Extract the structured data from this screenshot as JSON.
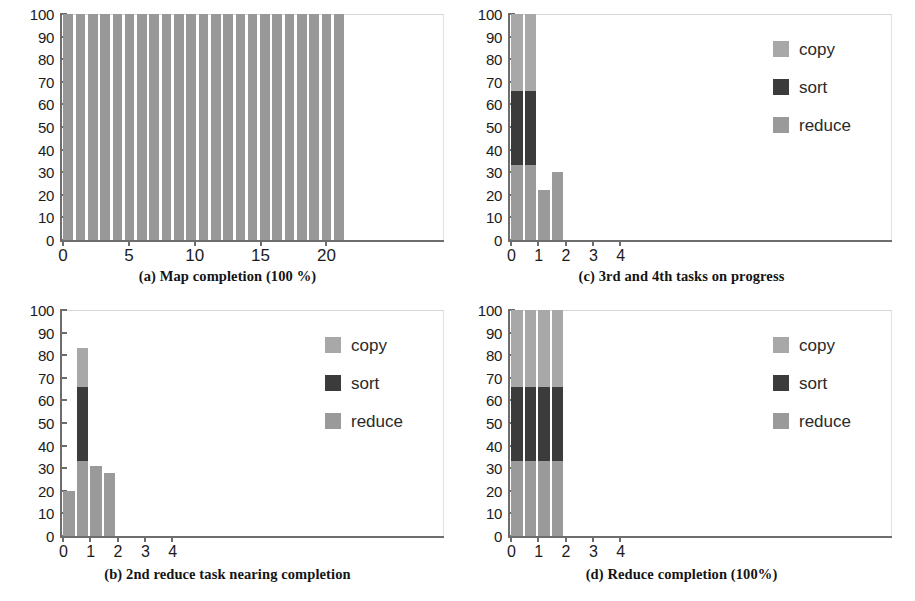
{
  "figure": {
    "colors": {
      "copy": "#a8a8a8",
      "sort": "#3b3b3b",
      "reduce": "#9a9a9a",
      "bar_a": "#989898",
      "axis": "#6d6d6d",
      "text": "#1b1b1b",
      "background": "#ffffff"
    },
    "legend_labels": {
      "copy": "copy",
      "sort": "sort",
      "reduce": "reduce"
    },
    "y_ticks": [
      "0",
      "10",
      "20",
      "30",
      "40",
      "50",
      "60",
      "70",
      "80",
      "90",
      "100"
    ]
  },
  "chart_data": [
    {
      "id": "a",
      "type": "bar",
      "title": "(a) Map completion (100 %)",
      "xlabel": "",
      "ylabel": "",
      "ylim": [
        0,
        100
      ],
      "xlim": [
        0,
        29
      ],
      "grid": false,
      "legend": false,
      "x_tick_labels": [
        "0",
        "5",
        "10",
        "15",
        "20"
      ],
      "x_tick_values": [
        0,
        5,
        10,
        15,
        20
      ],
      "series": [
        {
          "name": "map",
          "color": "#989898",
          "values": [
            100,
            100,
            100,
            100,
            100,
            100,
            100,
            100,
            100,
            100,
            100,
            100,
            100,
            100,
            100,
            100,
            100,
            100,
            100,
            100,
            100,
            100,
            100
          ]
        }
      ],
      "categories": [
        "0",
        "1",
        "2",
        "3",
        "4",
        "5",
        "6",
        "7",
        "8",
        "9",
        "10",
        "11",
        "12",
        "13",
        "14",
        "15",
        "16",
        "17",
        "18",
        "19",
        "20",
        "21",
        "22"
      ],
      "notes": "23 map tasks all at 100% completion"
    },
    {
      "id": "c",
      "type": "bar",
      "title": "(c) 3rd and 4th tasks on progress",
      "xlabel": "",
      "ylabel": "",
      "ylim": [
        0,
        100
      ],
      "xlim": [
        0,
        14
      ],
      "grid": false,
      "legend": true,
      "legend_position": "right",
      "x_tick_labels": [
        "0",
        "1",
        "2",
        "3",
        "4"
      ],
      "x_tick_values": [
        0,
        1,
        2,
        3,
        4
      ],
      "categories": [
        "0",
        "1",
        "2",
        "3"
      ],
      "stacked": true,
      "series": [
        {
          "name": "reduce",
          "color": "#9a9a9a",
          "values": [
            33,
            33,
            22,
            30
          ]
        },
        {
          "name": "sort",
          "color": "#3b3b3b",
          "values": [
            33,
            33,
            0,
            0
          ]
        },
        {
          "name": "copy",
          "color": "#a8a8a8",
          "values": [
            34,
            34,
            0,
            0
          ]
        }
      ],
      "totals": [
        100,
        100,
        22,
        30
      ]
    },
    {
      "id": "b",
      "type": "bar",
      "title": "(b) 2nd reduce task nearing completion",
      "xlabel": "",
      "ylabel": "",
      "ylim": [
        0,
        100
      ],
      "xlim": [
        0,
        14
      ],
      "grid": false,
      "legend": true,
      "legend_position": "right",
      "x_tick_labels": [
        "0",
        "1",
        "2",
        "3",
        "4"
      ],
      "x_tick_values": [
        0,
        1,
        2,
        3,
        4
      ],
      "categories": [
        "0",
        "1",
        "2",
        "3"
      ],
      "stacked": true,
      "series": [
        {
          "name": "reduce",
          "color": "#9a9a9a",
          "values": [
            20,
            33,
            31,
            28
          ]
        },
        {
          "name": "sort",
          "color": "#3b3b3b",
          "values": [
            0,
            33,
            0,
            0
          ]
        },
        {
          "name": "copy",
          "color": "#a8a8a8",
          "values": [
            0,
            17,
            0,
            0
          ]
        }
      ],
      "totals": [
        20,
        83,
        31,
        28
      ]
    },
    {
      "id": "d",
      "type": "bar",
      "title": "(d) Reduce completion (100%)",
      "xlabel": "",
      "ylabel": "",
      "ylim": [
        0,
        100
      ],
      "xlim": [
        0,
        14
      ],
      "grid": false,
      "legend": true,
      "legend_position": "right",
      "x_tick_labels": [
        "0",
        "1",
        "2",
        "3",
        "4"
      ],
      "x_tick_values": [
        0,
        1,
        2,
        3,
        4
      ],
      "categories": [
        "0",
        "1",
        "2",
        "3"
      ],
      "stacked": true,
      "series": [
        {
          "name": "reduce",
          "color": "#9a9a9a",
          "values": [
            33,
            33,
            33,
            33
          ]
        },
        {
          "name": "sort",
          "color": "#3b3b3b",
          "values": [
            33,
            33,
            33,
            33
          ]
        },
        {
          "name": "copy",
          "color": "#a8a8a8",
          "values": [
            34,
            34,
            34,
            34
          ]
        }
      ],
      "totals": [
        100,
        100,
        100,
        100
      ]
    }
  ]
}
